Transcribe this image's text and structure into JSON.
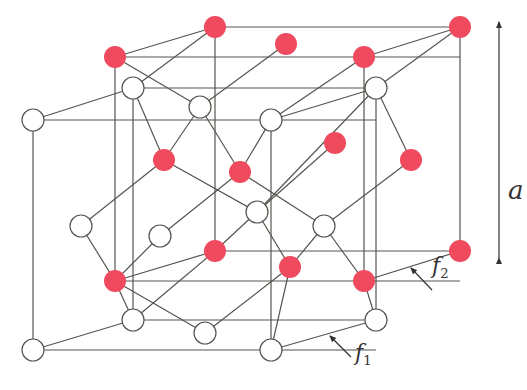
{
  "diagram": {
    "type": "crystal-structure",
    "colors": {
      "bond": "#555550",
      "atom_open_stroke": "#555550",
      "atom_open_fill": "#ffffff",
      "atom_filled": "#ef4a5e"
    },
    "atom_radius": 11,
    "labels": {
      "lattice_constant": "a",
      "f2_base": "f",
      "f2_sub": "2",
      "f1_base": "f",
      "f1_sub": "1"
    },
    "open_atoms": [
      [
        33,
        120
      ],
      [
        133,
        88
      ],
      [
        200,
        107
      ],
      [
        271,
        120
      ],
      [
        376,
        88
      ],
      [
        81,
        226
      ],
      [
        160,
        236
      ],
      [
        257,
        212
      ],
      [
        324,
        226
      ],
      [
        33,
        350
      ],
      [
        133,
        320
      ],
      [
        205,
        333
      ],
      [
        271,
        350
      ],
      [
        376,
        320
      ]
    ],
    "filled_atoms": [
      [
        115,
        57
      ],
      [
        215,
        27
      ],
      [
        286,
        44
      ],
      [
        364,
        57
      ],
      [
        460,
        27
      ],
      [
        164,
        160
      ],
      [
        240,
        172
      ],
      [
        335,
        143
      ],
      [
        411,
        160
      ],
      [
        115,
        281
      ],
      [
        215,
        251
      ],
      [
        290,
        267
      ],
      [
        364,
        281
      ],
      [
        460,
        251
      ]
    ],
    "bonds": [
      [
        33,
        120,
        376,
        120
      ],
      [
        33,
        120,
        33,
        350
      ],
      [
        33,
        350,
        376,
        350
      ],
      [
        133,
        88,
        376,
        88
      ],
      [
        133,
        88,
        133,
        320
      ],
      [
        133,
        320,
        376,
        320
      ],
      [
        376,
        88,
        376,
        320
      ],
      [
        271,
        120,
        271,
        350
      ],
      [
        33,
        120,
        133,
        88
      ],
      [
        33,
        350,
        133,
        320
      ],
      [
        271,
        350,
        376,
        320
      ],
      [
        271,
        120,
        376,
        88
      ],
      [
        115,
        57,
        460,
        57
      ],
      [
        115,
        57,
        115,
        281
      ],
      [
        115,
        281,
        460,
        281
      ],
      [
        215,
        27,
        460,
        27
      ],
      [
        215,
        27,
        215,
        251
      ],
      [
        215,
        251,
        460,
        251
      ],
      [
        460,
        27,
        460,
        251
      ],
      [
        364,
        57,
        364,
        281
      ],
      [
        115,
        57,
        215,
        27
      ],
      [
        364,
        57,
        460,
        27
      ],
      [
        115,
        281,
        215,
        251
      ],
      [
        364,
        281,
        460,
        251
      ],
      [
        115,
        57,
        200,
        107
      ],
      [
        215,
        27,
        133,
        88
      ],
      [
        286,
        44,
        200,
        107
      ],
      [
        460,
        27,
        376,
        88
      ],
      [
        364,
        57,
        271,
        120
      ],
      [
        133,
        88,
        164,
        160
      ],
      [
        200,
        107,
        164,
        160
      ],
      [
        200,
        107,
        240,
        172
      ],
      [
        271,
        120,
        240,
        172
      ],
      [
        376,
        88,
        411,
        160
      ],
      [
        164,
        160,
        81,
        226
      ],
      [
        164,
        160,
        257,
        212
      ],
      [
        240,
        172,
        160,
        236
      ],
      [
        240,
        172,
        324,
        226
      ],
      [
        335,
        143,
        257,
        212
      ],
      [
        411,
        160,
        324,
        226
      ],
      [
        376,
        88,
        257,
        212
      ],
      [
        81,
        226,
        115,
        281
      ],
      [
        160,
        236,
        115,
        281
      ],
      [
        257,
        212,
        215,
        251
      ],
      [
        257,
        212,
        290,
        267
      ],
      [
        324,
        226,
        290,
        267
      ],
      [
        324,
        226,
        364,
        281
      ],
      [
        115,
        281,
        205,
        333
      ],
      [
        215,
        251,
        133,
        320
      ],
      [
        290,
        267,
        271,
        350
      ],
      [
        364,
        281,
        376,
        320
      ],
      [
        290,
        267,
        205,
        333
      ],
      [
        115,
        281,
        133,
        320
      ]
    ],
    "arrows": [
      {
        "name": "lattice-constant-arrow",
        "x1": 499,
        "y1": 258,
        "x2": 499,
        "y2": 22,
        "double": true
      },
      {
        "name": "f2-pointer",
        "x1": 432,
        "y1": 290,
        "x2": 411,
        "y2": 268
      },
      {
        "name": "f1-pointer",
        "x1": 351,
        "y1": 357,
        "x2": 330,
        "y2": 336
      }
    ]
  }
}
